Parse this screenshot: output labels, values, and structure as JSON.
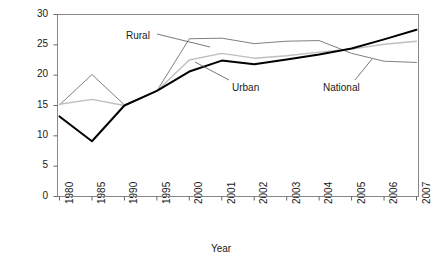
{
  "chart_data": {
    "type": "line",
    "title": "",
    "xlabel": "Year",
    "ylabel": "Rate of saving (% of income)",
    "categories": [
      "1980",
      "1985",
      "1990",
      "1995",
      "2000",
      "2001",
      "2002",
      "2003",
      "2004",
      "2005",
      "2006",
      "2007"
    ],
    "yticks": [
      0,
      5,
      10,
      15,
      20,
      25,
      30
    ],
    "ylim": [
      0,
      30
    ],
    "grid": false,
    "legend": "inline-annotations",
    "series": [
      {
        "name": "Rural",
        "color": "#7f7f7f",
        "width": 1,
        "values": [
          15.1,
          20.1,
          15.1,
          17.4,
          26.0,
          26.1,
          25.2,
          25.6,
          25.7,
          23.6,
          22.3,
          22.1
        ]
      },
      {
        "name": "National",
        "color": "#bfbfbf",
        "width": 1.4,
        "values": [
          15.2,
          16.0,
          15.0,
          17.4,
          22.5,
          23.6,
          22.8,
          23.2,
          23.8,
          24.3,
          25.1,
          25.6
        ]
      },
      {
        "name": "Urban",
        "color": "#000000",
        "width": 2,
        "values": [
          13.2,
          9.1,
          15.0,
          17.4,
          20.6,
          22.4,
          21.8,
          22.6,
          23.4,
          24.4,
          25.9,
          27.5
        ]
      }
    ],
    "annotations": [
      {
        "name": "Rural",
        "label": "Rural",
        "x": 126,
        "y": 30,
        "leader": {
          "x1": 157,
          "y1": 34,
          "x2": 210,
          "y2": 47
        }
      },
      {
        "name": "Urban",
        "label": "Urban",
        "x": 232,
        "y": 82,
        "leader": {
          "x1": 229,
          "y1": 80,
          "x2": 195,
          "y2": 62
        }
      },
      {
        "name": "National",
        "label": "National",
        "x": 323,
        "y": 82,
        "leader": {
          "x1": 355,
          "y1": 80,
          "x2": 372,
          "y2": 59
        }
      }
    ]
  },
  "axes": {
    "y_label": "Rate of saving (% of income)",
    "x_label": "Year"
  },
  "ytick_labels": [
    "30",
    "25",
    "20",
    "15",
    "10",
    "5",
    "0"
  ],
  "xtick_labels": [
    "1980",
    "1985",
    "1990",
    "1995",
    "2000",
    "2001",
    "2002",
    "2003",
    "2004",
    "2005",
    "2006",
    "2007"
  ],
  "series_labels": {
    "rural": "Rural",
    "urban": "Urban",
    "national": "National"
  }
}
